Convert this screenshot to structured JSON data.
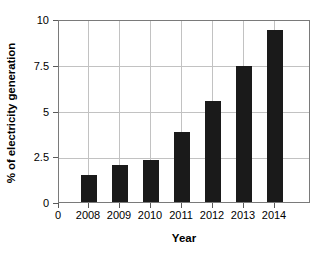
{
  "chart_data": {
    "type": "bar",
    "title": "",
    "xlabel": "Year",
    "ylabel": "% of electricity generation",
    "categories": [
      "2008",
      "2009",
      "2010",
      "2011",
      "2012",
      "2013",
      "2014"
    ],
    "values": [
      1.5,
      2.0,
      2.3,
      3.8,
      5.5,
      7.45,
      9.4
    ],
    "series": [
      {
        "name": "% of electricity generation",
        "values": [
          1.5,
          2.0,
          2.3,
          3.8,
          5.5,
          7.45,
          9.4
        ]
      }
    ],
    "ylim": [
      0,
      10
    ],
    "ytick_labels": [
      "0",
      "2.5",
      "5",
      "7.5",
      "10"
    ],
    "ytick_values": [
      0,
      2.5,
      5,
      7.5,
      10
    ],
    "xtick_labels": [
      "0",
      "2008",
      "2009",
      "2010",
      "2011",
      "2012",
      "2013",
      "2014"
    ],
    "grid": true,
    "legend": "none",
    "bar_color": "#1a1a1a",
    "grid_color": "#c2c2c2",
    "axis_color": "#7a7a7a",
    "background_color": "#ffffff"
  }
}
